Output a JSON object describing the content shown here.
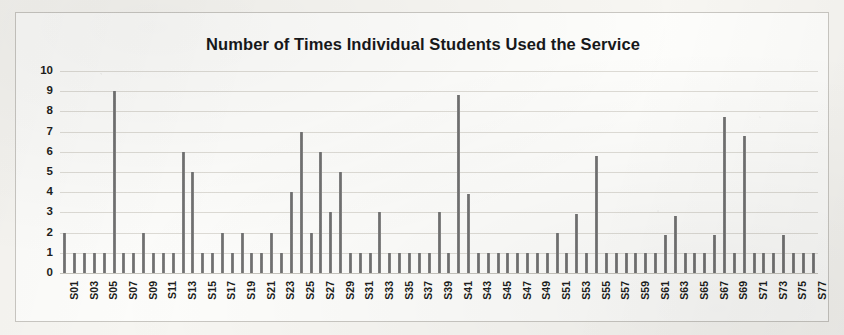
{
  "chart_data": {
    "type": "bar",
    "title": "Number of Times Individual Students Used the Service",
    "xlabel": "",
    "ylabel": "",
    "ylim": [
      0,
      10
    ],
    "yticks": [
      0,
      1,
      2,
      3,
      4,
      5,
      6,
      7,
      8,
      9,
      10
    ],
    "ytick_labels": [
      "0",
      "1",
      "2",
      "3",
      "4",
      "5",
      "6",
      "7",
      "8",
      "9",
      "10"
    ],
    "grid": true,
    "legend": false,
    "legend_position": "none",
    "xtick_labels_shown": [
      "S01",
      "S03",
      "S05",
      "S07",
      "S09",
      "S11",
      "S13",
      "S15",
      "S17",
      "S19",
      "S21",
      "S23",
      "S25",
      "S27",
      "S29",
      "S31",
      "S33",
      "S35",
      "S37",
      "S39",
      "S41",
      "S43",
      "S45",
      "S47",
      "S49",
      "S51",
      "S53",
      "S55",
      "S57",
      "S59",
      "S61",
      "S63",
      "S65",
      "S67",
      "S69",
      "S71",
      "S73",
      "S75",
      "S77"
    ],
    "categories": [
      "S01",
      "S02",
      "S03",
      "S04",
      "S05",
      "S06",
      "S07",
      "S08",
      "S09",
      "S10",
      "S11",
      "S12",
      "S13",
      "S14",
      "S15",
      "S16",
      "S17",
      "S18",
      "S19",
      "S20",
      "S21",
      "S22",
      "S23",
      "S24",
      "S25",
      "S26",
      "S27",
      "S28",
      "S29",
      "S30",
      "S31",
      "S32",
      "S33",
      "S34",
      "S35",
      "S36",
      "S37",
      "S38",
      "S39",
      "S40",
      "S41",
      "S42",
      "S43",
      "S44",
      "S45",
      "S46",
      "S47",
      "S48",
      "S49",
      "S50",
      "S51",
      "S52",
      "S53",
      "S54",
      "S55",
      "S56",
      "S57",
      "S58",
      "S59",
      "S60",
      "S61",
      "S62",
      "S63",
      "S64",
      "S65",
      "S66",
      "S67",
      "S68",
      "S69",
      "S70",
      "S71",
      "S72",
      "S73",
      "S74",
      "S75",
      "S76",
      "S77"
    ],
    "values": [
      2,
      1,
      1,
      1,
      1,
      9,
      1,
      1,
      2,
      1,
      1,
      1,
      6,
      5,
      1,
      1,
      2,
      1,
      2,
      1,
      1,
      2,
      1,
      4,
      7,
      2,
      6,
      3,
      5,
      1,
      1,
      1,
      3,
      1,
      1,
      1,
      1,
      1,
      3,
      1,
      8.8,
      3.9,
      1,
      1,
      1,
      1,
      1,
      1,
      1,
      1,
      2,
      1,
      2.9,
      1,
      5.8,
      1,
      1,
      1,
      1,
      1,
      1,
      1.9,
      2.8,
      1,
      1,
      1,
      1.9,
      7.7,
      1,
      6.8,
      1,
      1,
      1,
      1.9,
      1,
      1,
      1
    ],
    "bar_color": "#7d7d7d",
    "grid_color": "#dedcd6",
    "text_color": "#1d1e20",
    "background_color": "#fdfdfb"
  }
}
